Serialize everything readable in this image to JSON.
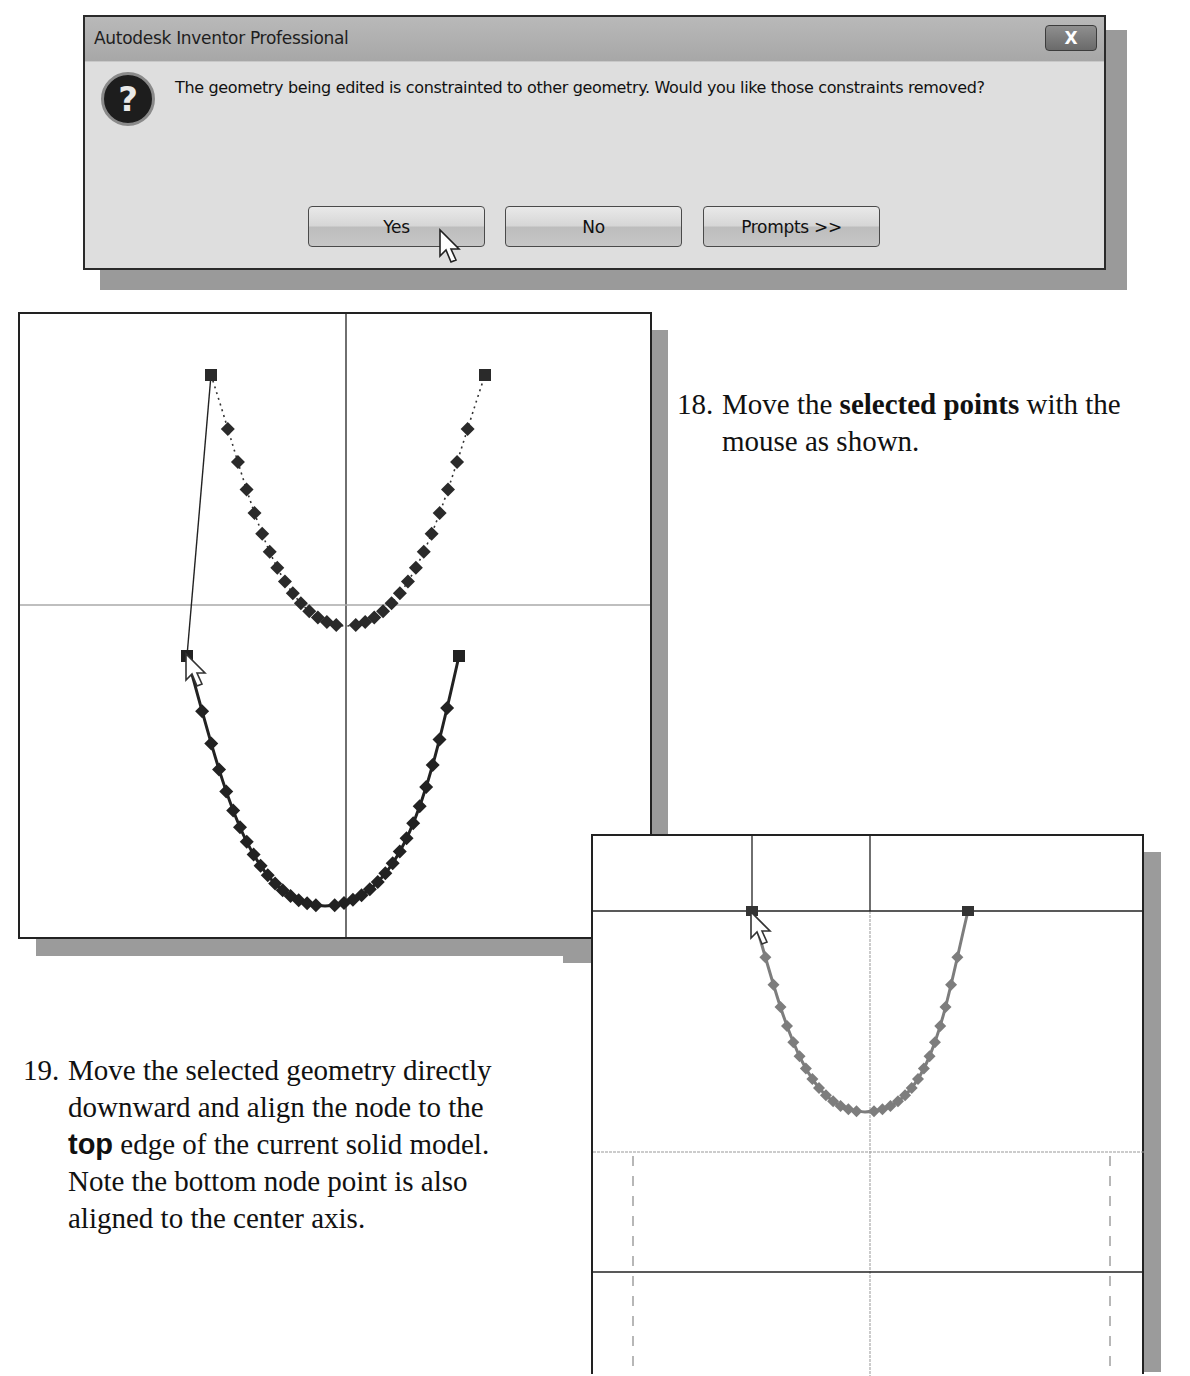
{
  "dialog": {
    "title": "Autodesk Inventor Professional",
    "close_label": "X",
    "icon": "question-icon",
    "icon_glyph": "?",
    "message": "The geometry being edited is constrainted to other geometry. Would you like those constraints removed?",
    "buttons": [
      {
        "label": "Yes"
      },
      {
        "label": "No"
      },
      {
        "label": "Prompts >>"
      }
    ]
  },
  "steps": [
    {
      "number": "18.",
      "parts": [
        {
          "text": "Move the ",
          "bold": false
        },
        {
          "text": "selected points",
          "bold": true
        },
        {
          "text": " with the",
          "bold": false
        }
      ],
      "line2": "mouse as shown."
    },
    {
      "number": "19.",
      "line1": "Move the selected geometry directly",
      "line2": "downward and align the node to the",
      "line3_bold": "top",
      "line3_rest": " edge of the current solid model.",
      "line4": "Note the bottom node point is also",
      "line5": "aligned to the center axis."
    }
  ],
  "sketch_views": [
    {
      "name": "before-move",
      "description": "Original spline (dotted, upper) and moved spline (solid, lower) with cursor at left end node"
    },
    {
      "name": "after-align",
      "description": "Spline aligned to top edge of solid model; bottom node on center axis"
    }
  ],
  "colors": {
    "dialog_bg": "#dedede",
    "titlebar": "#adadad",
    "shadow": "#9b9b9b",
    "spline_dark": "#2a2a2a",
    "spline_gray": "#7d7d7d"
  }
}
